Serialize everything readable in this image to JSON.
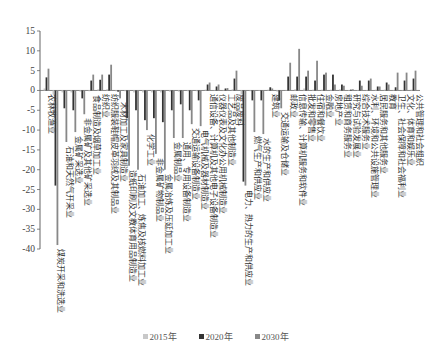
{
  "chart_data": {
    "type": "bar",
    "title": "",
    "xlabel": "",
    "ylabel": "",
    "ylim": [
      -40,
      15
    ],
    "yticks": [
      15,
      10,
      5,
      0,
      -5,
      -10,
      -15,
      -20,
      -25,
      -30,
      -35,
      -40
    ],
    "grid": false,
    "legend_position": "bottom-center",
    "categories": [
      "农林牧渔业",
      "煤炭开采和洗选业",
      "石油和天然气开采业",
      "金属矿采选业",
      "非金属矿及其他矿采选业",
      "食品制造及烟草加工业",
      "纺织业",
      "纺织服装鞋帽皮革羽绒及其制品业",
      "木材加工及家具制造业",
      "造纸印刷及文教体育用品制造业",
      "石油加工、炼焦及核燃料加工业",
      "化学工业",
      "非金属矿物制品业",
      "金属冶炼及压延加工业",
      "金属制品业",
      "通用、专用设备制造业",
      "交通运输设备制造业",
      "电气机械及器材制造业",
      "通信设备、计算机及其他电子设备制造业",
      "仪器仪表及文化办公用机械制造业",
      "工艺品及其他制造业",
      "废品废料",
      "电力、热力的生产和供应业",
      "燃气生产和供应业",
      "水的生产和供应业",
      "建筑业",
      "交通运输及仓储业",
      "邮政业",
      "信息传输、计算机服务和软件业",
      "批发和零售业",
      "住宿和餐饮业",
      "金融业",
      "房地产业",
      "租赁和商务服务业",
      "研究与试验发展业",
      "综合技术服务业",
      "水利、环境和公共设施管理业",
      "居民服务和其他服务业",
      "教育",
      "卫生、社会保障和社会福利业",
      "文化、体育和娱乐业",
      "公共管理和社会组织"
    ],
    "series": [
      {
        "name": "2015年",
        "color": "#c8c8c8",
        "values": [
          0.5,
          -1,
          -0.5,
          -0.5,
          -0.3,
          -0.2,
          0.3,
          0.3,
          -0.2,
          -0.2,
          -0.5,
          -0.5,
          -0.5,
          -0.5,
          -0.3,
          -0.3,
          -0.2,
          -0.2,
          0.2,
          0.1,
          0.1,
          0.3,
          -1,
          -0.2,
          -0.1,
          0.2,
          -0.3,
          0.1,
          0.3,
          0.5,
          0.2,
          0.2,
          0.2,
          0.3,
          0.1,
          0.1,
          0.1,
          0.2,
          0.2,
          0.1,
          0.1,
          0.2
        ]
      },
      {
        "name": "2020年",
        "color": "#333333",
        "values": [
          3.3,
          -24,
          -4.5,
          -5,
          -2,
          2.5,
          2.7,
          4,
          -0.3,
          -7,
          -5,
          -7.5,
          -7,
          -8,
          -5,
          -3.5,
          -5,
          -2.5,
          1.5,
          1,
          0.5,
          3,
          -23,
          -2.5,
          -2.5,
          0.8,
          -2.5,
          3.5,
          3.5,
          3.5,
          2.5,
          4,
          4,
          1.5,
          0.2,
          2.5,
          2.5,
          1,
          2,
          0.8,
          2.5,
          3
        ]
      },
      {
        "name": "2030年",
        "color": "#888888",
        "values": [
          5.5,
          -39,
          -13,
          -10.5,
          -6,
          4,
          4,
          6.5,
          -2,
          -19,
          -20,
          -10,
          -16,
          -20,
          -12,
          -12,
          -8.5,
          -9,
          2,
          1.5,
          0.6,
          5,
          -24,
          -10.5,
          -11,
          0.5,
          -4.5,
          7,
          10.5,
          5,
          7.5,
          4.5,
          1.5,
          1.2,
          0.3,
          1.2,
          3,
          1,
          1.5,
          4.5,
          4.5,
          5
        ]
      }
    ]
  },
  "legend": {
    "items": [
      {
        "label": "2015年",
        "color": "#c8c8c8"
      },
      {
        "label": "2020年",
        "color": "#333333"
      },
      {
        "label": "2030年",
        "color": "#888888"
      }
    ]
  }
}
